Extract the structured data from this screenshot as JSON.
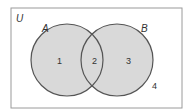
{
  "diagram": {
    "type": "venn",
    "universe_label": "U",
    "sets": [
      {
        "name": "A",
        "label": "A"
      },
      {
        "name": "B",
        "label": "B"
      }
    ],
    "regions": [
      {
        "id": "1",
        "label": "1",
        "description": "A only"
      },
      {
        "id": "2",
        "label": "2",
        "description": "A and B"
      },
      {
        "id": "3",
        "label": "3",
        "description": "B only"
      },
      {
        "id": "4",
        "label": "4",
        "description": "outside A and B"
      }
    ],
    "colors": {
      "fill": "#d9d9d9",
      "stroke": "#555555",
      "border": "#9a9a9a",
      "text": "#333333"
    }
  }
}
